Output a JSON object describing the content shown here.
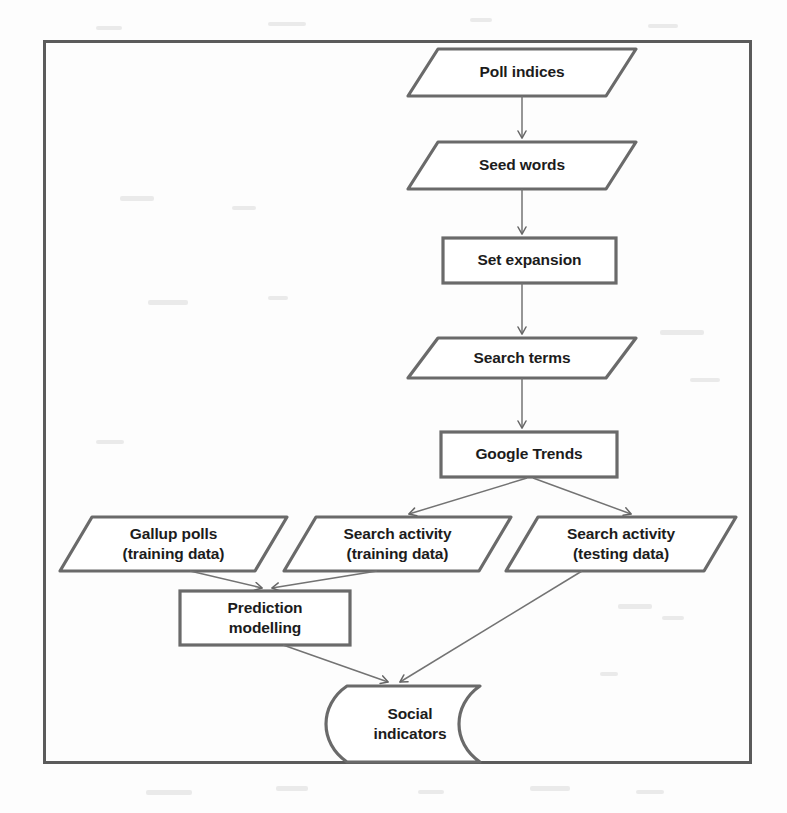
{
  "diagram": {
    "frame": {
      "name": "outer-border"
    },
    "stroke_color": "#5f5f5f",
    "text_color": "#1c1c1c",
    "background_color": "#fdfdfd",
    "nodes": [
      {
        "id": "poll-indices",
        "shape": "parallelogram",
        "lines": [
          "Poll indices"
        ]
      },
      {
        "id": "seed-words",
        "shape": "parallelogram",
        "lines": [
          "Seed words"
        ]
      },
      {
        "id": "set-expansion",
        "shape": "rectangle",
        "lines": [
          "Set expansion"
        ]
      },
      {
        "id": "search-terms",
        "shape": "parallelogram",
        "lines": [
          "Search terms"
        ]
      },
      {
        "id": "google-trends",
        "shape": "rectangle",
        "lines": [
          "Google Trends"
        ]
      },
      {
        "id": "gallup-polls",
        "shape": "parallelogram",
        "lines": [
          "Gallup polls",
          "(training data)"
        ]
      },
      {
        "id": "search-activity-training",
        "shape": "parallelogram",
        "lines": [
          "Search activity",
          "(training data)"
        ]
      },
      {
        "id": "search-activity-testing",
        "shape": "parallelogram",
        "lines": [
          "Search activity",
          "(testing data)"
        ]
      },
      {
        "id": "prediction-modelling",
        "shape": "rectangle",
        "lines": [
          "Prediction",
          "modelling"
        ]
      },
      {
        "id": "social-indicators",
        "shape": "stored-data",
        "lines": [
          "Social",
          "indicators"
        ]
      }
    ],
    "edges": [
      {
        "from": "poll-indices",
        "to": "seed-words"
      },
      {
        "from": "seed-words",
        "to": "set-expansion"
      },
      {
        "from": "set-expansion",
        "to": "search-terms"
      },
      {
        "from": "search-terms",
        "to": "google-trends"
      },
      {
        "from": "google-trends",
        "to": "search-activity-training"
      },
      {
        "from": "google-trends",
        "to": "search-activity-testing"
      },
      {
        "from": "gallup-polls",
        "to": "prediction-modelling"
      },
      {
        "from": "search-activity-training",
        "to": "prediction-modelling"
      },
      {
        "from": "prediction-modelling",
        "to": "social-indicators"
      },
      {
        "from": "search-activity-testing",
        "to": "social-indicators"
      }
    ]
  }
}
